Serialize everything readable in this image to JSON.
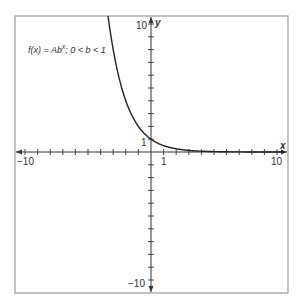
{
  "chart_data": {
    "type": "line",
    "title": "",
    "annotation": "f(x) = Abˣ; 0 < b < 1",
    "annotation_parts": {
      "prefix": "f(x) = Ab",
      "superscript": "x",
      "suffix": "; 0 < b < 1"
    },
    "xlabel": "x",
    "ylabel": "y",
    "xlim": [
      -10.5,
      10.8
    ],
    "ylim": [
      -10.8,
      10.6
    ],
    "grid": false,
    "legend": null,
    "x_tick_labels": [
      {
        "value": -10,
        "label": "−10"
      },
      {
        "value": 1,
        "label": "1"
      },
      {
        "value": 10,
        "label": "10"
      }
    ],
    "y_tick_labels": [
      {
        "value": 10,
        "label": "10"
      },
      {
        "value": 1,
        "label": "1"
      },
      {
        "value": -10,
        "label": "−10"
      }
    ],
    "ticks_every": 1,
    "series": [
      {
        "name": "f(x) = Ab^x",
        "function": "A*b^x",
        "params": {
          "A": 1,
          "b": 0.5
        },
        "x": [
          -3.4,
          -3,
          -2,
          -1,
          0,
          1,
          2,
          3,
          4,
          5,
          6,
          7,
          8,
          9,
          10
        ],
        "y": [
          10.56,
          8,
          4,
          2,
          1,
          0.5,
          0.25,
          0.125,
          0.0625,
          0.031,
          0.016,
          0.008,
          0.004,
          0.002,
          0.001
        ],
        "color": "#222222"
      }
    ]
  },
  "labels": {
    "x_axis": "x",
    "y_axis": "y",
    "x_neg10": "−10",
    "x_1": "1",
    "x_10": "10",
    "y_10": "10",
    "y_1": "1",
    "y_neg10": "−10",
    "func_prefix": "f(x) = Ab",
    "func_sup": "x",
    "func_suffix": "; 0 < b < 1"
  },
  "colors": {
    "frame": "#9a9a9a",
    "axis": "#333333",
    "curve": "#222222"
  }
}
